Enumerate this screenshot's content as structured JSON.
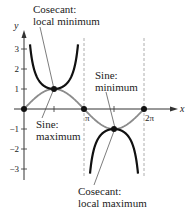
{
  "chart_data": {
    "type": "line",
    "title": "",
    "xlabel": "x",
    "ylabel": "y",
    "xlim": [
      0,
      2.6
    ],
    "ylim": [
      -3.7,
      3.7
    ],
    "x_unit": "pi",
    "x_ticks": [
      {
        "value": 0.5,
        "label": ""
      },
      {
        "value": 1,
        "label": "π"
      },
      {
        "value": 1.5,
        "label": ""
      },
      {
        "value": 2,
        "label": "2π"
      }
    ],
    "y_ticks": [
      {
        "value": 3,
        "label": "3"
      },
      {
        "value": 2,
        "label": "2"
      },
      {
        "value": 1,
        "label": "1"
      },
      {
        "value": -1,
        "label": "−1"
      },
      {
        "value": -2,
        "label": "−2"
      },
      {
        "value": -3,
        "label": "−3"
      }
    ],
    "asymptotes_x_pi": [
      1,
      2
    ],
    "grid": false,
    "series": [
      {
        "name": "y = sin x",
        "color": "#8c8c8c",
        "function": "sin",
        "domain_pi": [
          0,
          2
        ]
      },
      {
        "name": "y = csc x",
        "color": "#111111",
        "function": "csc",
        "domain_pi": [
          0,
          2
        ],
        "clip_y": 3.3
      }
    ],
    "points": [
      {
        "x_pi": 0,
        "y": 0
      },
      {
        "x_pi": 0.5,
        "y": 1
      },
      {
        "x_pi": 1,
        "y": 0
      },
      {
        "x_pi": 1.5,
        "y": -1
      },
      {
        "x_pi": 2,
        "y": 0
      }
    ],
    "annotations": [
      {
        "id": "csc-local-min",
        "lines": [
          "Cosecant:",
          "local minimum"
        ],
        "target": {
          "x_pi": 0.5,
          "y": 1
        }
      },
      {
        "id": "sin-max",
        "lines": [
          "Sine:",
          "maximum"
        ],
        "target": {
          "x_pi": 0.5,
          "y": 1
        }
      },
      {
        "id": "sin-min",
        "lines": [
          "Sine:",
          "minimum"
        ],
        "target": {
          "x_pi": 1.5,
          "y": -1
        }
      },
      {
        "id": "csc-local-max",
        "lines": [
          "Cosecant:",
          "local maximum"
        ],
        "target": {
          "x_pi": 1.5,
          "y": -1
        }
      }
    ]
  }
}
